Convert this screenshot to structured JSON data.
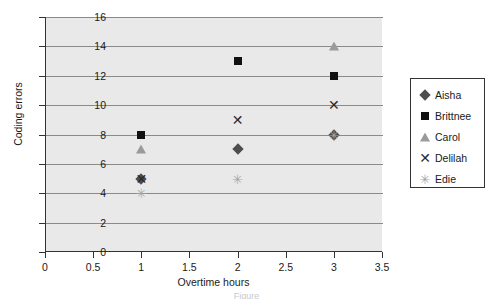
{
  "chart_data": {
    "type": "scatter",
    "title": "",
    "xlabel": "Overtime hours",
    "ylabel": "Coding errors",
    "xlim": [
      0,
      3.5
    ],
    "ylim": [
      0,
      16
    ],
    "xticks": [
      "0",
      "0.5",
      "1",
      "1.5",
      "2",
      "2.5",
      "3",
      "3.5"
    ],
    "xtick_values": [
      0,
      0.5,
      1,
      1.5,
      2,
      2.5,
      3,
      3.5
    ],
    "yticks": [
      "0",
      "2",
      "4",
      "6",
      "8",
      "10",
      "12",
      "14",
      "16"
    ],
    "ytick_values": [
      0,
      2,
      4,
      6,
      8,
      10,
      12,
      14,
      16
    ],
    "grid": "horizontal",
    "legend_position": "right",
    "plot_background": "#e9e9e9",
    "series": [
      {
        "name": "Aisha",
        "marker": "diamond",
        "color": "#4d4d4d",
        "x": [
          1,
          2,
          3
        ],
        "y": [
          5,
          7,
          8
        ]
      },
      {
        "name": "Brittnee",
        "marker": "square",
        "color": "#111111",
        "x": [
          1,
          2,
          3
        ],
        "y": [
          8,
          13,
          12
        ]
      },
      {
        "name": "Carol",
        "marker": "triangle",
        "color": "#9a9a9a",
        "x": [
          1,
          3
        ],
        "y": [
          7,
          14
        ]
      },
      {
        "name": "Delilah",
        "marker": "x",
        "color": "#2b2b2b",
        "x": [
          1,
          2,
          3
        ],
        "y": [
          5,
          9,
          10
        ]
      },
      {
        "name": "Edie",
        "marker": "star",
        "color": "#a6a6a6",
        "x": [
          1,
          2,
          3
        ],
        "y": [
          4,
          5,
          8
        ]
      }
    ]
  },
  "caption": "Figure"
}
